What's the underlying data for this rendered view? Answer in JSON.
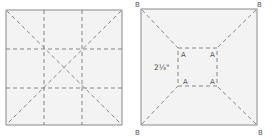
{
  "diagram": {
    "left_panel": {
      "description": "square with dashed fold lines: two vertical, two horizontal, two diagonals"
    },
    "right_panel": {
      "corner_labels": [
        "B",
        "B",
        "B",
        "B"
      ],
      "inner_labels": [
        "A",
        "A",
        "A",
        "A"
      ],
      "dimension_label": "2¼\""
    },
    "colors": {
      "fill": "#f2f2f2",
      "border": "#8a8a8a",
      "dash": "#777777"
    }
  }
}
